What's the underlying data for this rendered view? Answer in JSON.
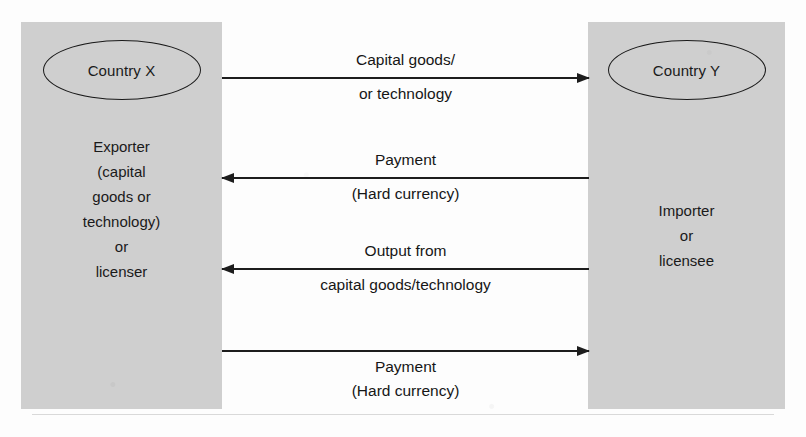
{
  "diagram": {
    "left_box": {
      "ellipse_label": "Country X",
      "role_lines": [
        "Exporter",
        "(capital",
        "goods or",
        "technology)",
        "or",
        "licenser"
      ]
    },
    "right_box": {
      "ellipse_label": "Country Y",
      "role_lines": [
        "Importer",
        "or",
        "licensee"
      ]
    },
    "flows": [
      {
        "direction": "right",
        "label_above": "Capital goods/",
        "label_below": "or technology"
      },
      {
        "direction": "left",
        "label_above": "Payment",
        "label_below": "(Hard currency)"
      },
      {
        "direction": "left",
        "label_above": "Output from",
        "label_below": "capital goods/technology"
      },
      {
        "direction": "right",
        "label_above": "",
        "label_below": "Payment",
        "label_below2": "(Hard currency)"
      }
    ],
    "colors": {
      "box_fill": "#cfcfcf",
      "line": "#1d1d1d",
      "text": "#161616",
      "page": "#fdfdfd"
    }
  }
}
